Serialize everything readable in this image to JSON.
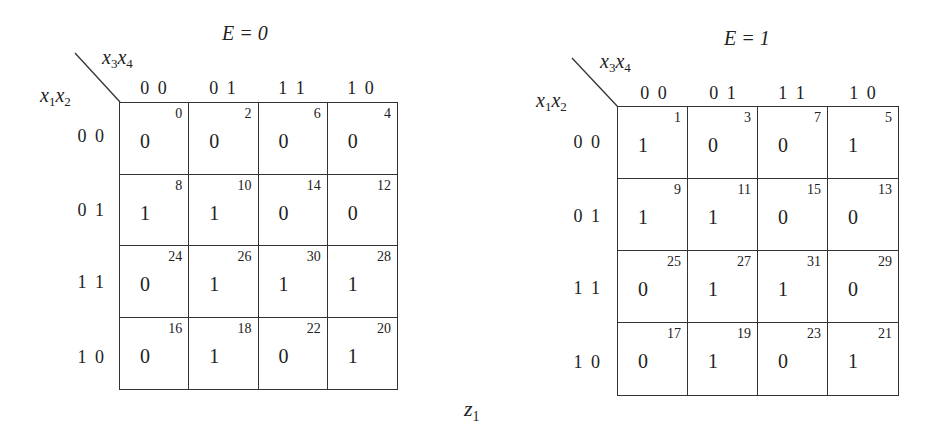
{
  "figure": {
    "function_label": {
      "name": "z",
      "sub": "1"
    },
    "row_var": {
      "name1": "x",
      "sub1": "1",
      "name2": "x",
      "sub2": "2"
    },
    "col_var": {
      "name1": "x",
      "sub1": "3",
      "name2": "x",
      "sub2": "4"
    }
  },
  "maps": [
    {
      "title": "E = 0",
      "col_headers": [
        "0 0",
        "0 1",
        "1 1",
        "1 0"
      ],
      "row_headers": [
        "0 0",
        "0 1",
        "1 1",
        "1 0"
      ],
      "cells": [
        [
          {
            "value": "0",
            "index": "0"
          },
          {
            "value": "0",
            "index": "2"
          },
          {
            "value": "0",
            "index": "6"
          },
          {
            "value": "0",
            "index": "4"
          }
        ],
        [
          {
            "value": "1",
            "index": "8"
          },
          {
            "value": "1",
            "index": "10"
          },
          {
            "value": "0",
            "index": "14"
          },
          {
            "value": "0",
            "index": "12"
          }
        ],
        [
          {
            "value": "0",
            "index": "24"
          },
          {
            "value": "1",
            "index": "26"
          },
          {
            "value": "1",
            "index": "30"
          },
          {
            "value": "1",
            "index": "28"
          }
        ],
        [
          {
            "value": "0",
            "index": "16"
          },
          {
            "value": "1",
            "index": "18"
          },
          {
            "value": "0",
            "index": "22"
          },
          {
            "value": "1",
            "index": "20"
          }
        ]
      ]
    },
    {
      "title": "E = 1",
      "col_headers": [
        "0 0",
        "0 1",
        "1 1",
        "1 0"
      ],
      "row_headers": [
        "0 0",
        "0 1",
        "1 1",
        "1 0"
      ],
      "cells": [
        [
          {
            "value": "1",
            "index": "1"
          },
          {
            "value": "0",
            "index": "3"
          },
          {
            "value": "0",
            "index": "7"
          },
          {
            "value": "1",
            "index": "5"
          }
        ],
        [
          {
            "value": "1",
            "index": "9"
          },
          {
            "value": "1",
            "index": "11"
          },
          {
            "value": "0",
            "index": "15"
          },
          {
            "value": "0",
            "index": "13"
          }
        ],
        [
          {
            "value": "0",
            "index": "25"
          },
          {
            "value": "1",
            "index": "27"
          },
          {
            "value": "1",
            "index": "31"
          },
          {
            "value": "0",
            "index": "29"
          }
        ],
        [
          {
            "value": "0",
            "index": "17"
          },
          {
            "value": "1",
            "index": "19"
          },
          {
            "value": "0",
            "index": "23"
          },
          {
            "value": "1",
            "index": "21"
          }
        ]
      ]
    }
  ]
}
